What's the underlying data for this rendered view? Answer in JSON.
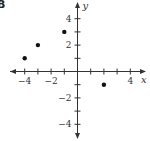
{
  "figure_label": "B",
  "chart_data": {
    "type": "scatter",
    "title": "",
    "xlabel": "x",
    "ylabel": "y",
    "xlim": [
      -5,
      5
    ],
    "ylim": [
      -5,
      5
    ],
    "grid": false,
    "x_ticks": [
      -4,
      -3,
      -2,
      -1,
      1,
      2,
      3,
      4
    ],
    "y_ticks": [
      -4,
      -3,
      -2,
      -1,
      1,
      2,
      3,
      4
    ],
    "x_tick_labels": [
      "-4",
      "-2",
      "4"
    ],
    "y_tick_labels": [
      "4",
      "2",
      "-2",
      "-4"
    ],
    "points": [
      {
        "x": -4,
        "y": 1
      },
      {
        "x": -3,
        "y": 2
      },
      {
        "x": -1,
        "y": 3
      },
      {
        "x": 2,
        "y": -1
      }
    ],
    "colors": {
      "axis": "#333333",
      "point": "#111111"
    }
  }
}
